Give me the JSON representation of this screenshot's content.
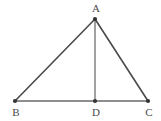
{
  "figure": {
    "type": "geometry-diagram",
    "shape_name": "triangle-with-cevian",
    "background_color": "#ffffff",
    "stroke_color": "#4a4a4a",
    "stroke_color_light": "#8a8a8a",
    "marker_color": "#333333",
    "label_color": "#4a4a4a",
    "stroke_width": 1.5,
    "canvas": {
      "width": 161,
      "height": 121
    },
    "points": [
      {
        "id": "A",
        "label": "A",
        "x": 95,
        "y": 19,
        "label_x": 96,
        "label_y": 12
      },
      {
        "id": "B",
        "label": "B",
        "x": 15,
        "y": 101,
        "label_x": 16,
        "label_y": 116
      },
      {
        "id": "D",
        "label": "D",
        "x": 95,
        "y": 101,
        "label_x": 96,
        "label_y": 116
      },
      {
        "id": "C",
        "label": "C",
        "x": 148,
        "y": 101,
        "label_x": 149,
        "label_y": 116
      }
    ],
    "segments": [
      {
        "id": "AB",
        "from": "A",
        "to": "B",
        "x1": 95,
        "y1": 19,
        "x2": 15,
        "y2": 101,
        "color": "#4a4a4a",
        "width": 1.6
      },
      {
        "id": "AC",
        "from": "A",
        "to": "C",
        "x1": 95,
        "y1": 19,
        "x2": 148,
        "y2": 101,
        "color": "#4a4a4a",
        "width": 1.6
      },
      {
        "id": "BC",
        "from": "B",
        "to": "C",
        "x1": 15,
        "y1": 101,
        "x2": 148,
        "y2": 101,
        "color": "#6a6a6a",
        "width": 1.6
      },
      {
        "id": "AD",
        "from": "A",
        "to": "D",
        "x1": 95,
        "y1": 19,
        "x2": 95,
        "y2": 101,
        "color": "#8a8a8a",
        "width": 1.6
      }
    ],
    "marker_radius": 2.1
  }
}
